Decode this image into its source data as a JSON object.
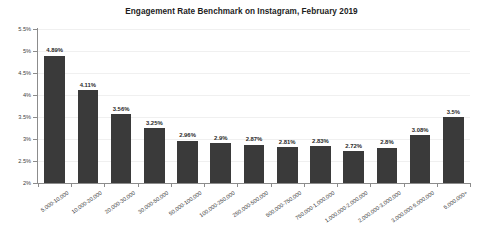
{
  "chart_data": {
    "type": "bar",
    "title": "Engagement Rate Benchmark on Instagram, February 2019",
    "xlabel": "",
    "ylabel": "",
    "ylim": [
      2,
      5.5
    ],
    "ytick_labels": [
      "5.5%",
      "5%",
      "4.5%",
      "4%",
      "3.5%",
      "3%",
      "2.5%",
      "2%"
    ],
    "ytick_values": [
      5.5,
      5,
      4.5,
      4,
      3.5,
      3,
      2.5,
      2
    ],
    "grid": true,
    "legend": false,
    "bar_color": "#3a3a3a",
    "categories": [
      "5,000-10,000",
      "10,000-20,000",
      "20,000-30,000",
      "30,000-50,000",
      "50,000-100,000",
      "100,000-250,000",
      "250,000-500,000",
      "500,000-750,000",
      "750,000-1,000,000",
      "1,000,000-2,000,000",
      "2,000,000-3,000,000",
      "3,000,000-5,000,000",
      "5,000,000+"
    ],
    "values": [
      4.89,
      4.11,
      3.56,
      3.25,
      2.96,
      2.9,
      2.87,
      2.81,
      2.83,
      2.72,
      2.8,
      3.08,
      3.5
    ],
    "value_labels": [
      "4.89%",
      "4.11%",
      "3.56%",
      "3.25%",
      "2.96%",
      "2.9%",
      "2.87%",
      "2.81%",
      "2.83%",
      "2.72%",
      "2.8%",
      "3.08%",
      "3.5%"
    ]
  }
}
